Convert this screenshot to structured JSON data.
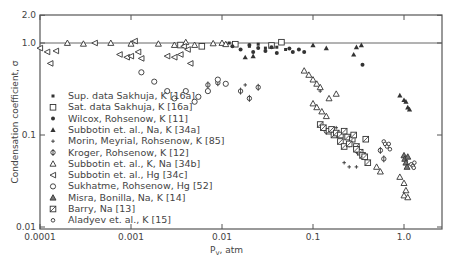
{
  "chart_data": {
    "type": "scatter",
    "title": "",
    "xlabel": "P_v, atm",
    "ylabel": "Condensation coefficient, σ",
    "xscale": "log",
    "yscale": "log",
    "xlim": [
      0.0001,
      3.0
    ],
    "ylim": [
      0.01,
      2.0
    ],
    "x_ticks": [
      "0.0001",
      "0.001",
      "0.01",
      "0.1",
      "1.0"
    ],
    "y_ticks": [
      "0.01",
      "0.1",
      "1.0",
      "2.0"
    ],
    "reference_line": {
      "y": 1.0
    },
    "legend_position": "inside-left",
    "grid": false,
    "series": [
      {
        "name": "Sup. data Sakhuja, K [16a]",
        "marker": "filled-square-small",
        "points": [
          [
            0.012,
            1.0
          ],
          [
            0.014,
            0.95
          ],
          [
            0.02,
            0.92
          ],
          [
            0.025,
            0.97
          ],
          [
            0.03,
            0.88
          ],
          [
            0.04,
            0.9
          ],
          [
            0.05,
            0.85
          ]
        ]
      },
      {
        "name": "Sat. data Sakhuja, K [16a]",
        "marker": "open-square",
        "points": [
          [
            0.0035,
            0.95
          ],
          [
            0.006,
            0.92
          ],
          [
            0.014,
            0.97
          ],
          [
            0.035,
            0.94
          ],
          [
            0.045,
            1.02
          ]
        ]
      },
      {
        "name": "Wilcox, Rohsenow, K [11]",
        "marker": "filled-circle",
        "points": [
          [
            0.013,
            0.92
          ],
          [
            0.016,
            0.85
          ],
          [
            0.02,
            0.95
          ],
          [
            0.022,
            0.8
          ],
          [
            0.025,
            0.88
          ],
          [
            0.03,
            0.82
          ],
          [
            0.035,
            0.9
          ],
          [
            0.04,
            0.78
          ],
          [
            0.055,
            0.87
          ],
          [
            0.06,
            0.8
          ],
          [
            0.07,
            0.85
          ],
          [
            0.08,
            0.8
          ],
          [
            0.35,
            0.58
          ]
        ]
      },
      {
        "name": "Subbotin et. al., Na, K [34a]",
        "marker": "filled-triangle",
        "points": [
          [
            0.018,
            0.7
          ],
          [
            0.022,
            0.72
          ],
          [
            0.1,
            0.95
          ],
          [
            0.14,
            0.88
          ],
          [
            0.3,
            0.9
          ],
          [
            0.34,
            0.95
          ],
          [
            0.28,
            0.75
          ],
          [
            0.9,
            0.27
          ],
          [
            1.0,
            0.24
          ],
          [
            1.05,
            0.23
          ],
          [
            1.1,
            0.2
          ],
          [
            1.15,
            0.19
          ]
        ]
      },
      {
        "name": "Morin, Meyrial, Rohsenow, K [85]",
        "marker": "plus",
        "points": [
          [
            0.018,
            0.35
          ],
          [
            0.12,
            0.3
          ],
          [
            0.15,
            0.11
          ],
          [
            0.17,
            0.1
          ],
          [
            0.18,
            0.12
          ],
          [
            0.22,
            0.05
          ],
          [
            0.25,
            0.045
          ],
          [
            0.3,
            0.045
          ]
        ]
      },
      {
        "name": "Kroger, Rohsenow, K [12]",
        "marker": "circle-bar",
        "points": [
          [
            0.007,
            0.35
          ],
          [
            0.009,
            0.37
          ],
          [
            0.016,
            0.3
          ],
          [
            0.02,
            0.25
          ],
          [
            0.025,
            0.33
          ],
          [
            0.14,
            0.11
          ],
          [
            0.25,
            0.08
          ],
          [
            0.3,
            0.068
          ],
          [
            0.55,
            0.068
          ],
          [
            0.6,
            0.055
          ]
        ]
      },
      {
        "name": "Subbotin et. al., K, Na [34b]",
        "marker": "open-triangle",
        "points": [
          [
            0.0002,
            1.0
          ],
          [
            0.0003,
            0.98
          ],
          [
            0.0006,
            1.0
          ],
          [
            0.001,
            0.98
          ],
          [
            0.002,
            0.98
          ],
          [
            0.003,
            0.95
          ],
          [
            0.004,
            1.02
          ],
          [
            0.005,
            0.95
          ],
          [
            0.008,
            0.99
          ],
          [
            0.01,
            1.0
          ],
          [
            0.011,
            0.97
          ],
          [
            0.08,
            0.5
          ],
          [
            0.09,
            0.45
          ],
          [
            0.1,
            0.4
          ],
          [
            0.11,
            0.36
          ],
          [
            0.12,
            0.33
          ],
          [
            0.1,
            0.22
          ],
          [
            0.11,
            0.2
          ],
          [
            0.125,
            0.18
          ],
          [
            0.14,
            0.16
          ],
          [
            0.15,
            0.25
          ],
          [
            0.18,
            0.28
          ],
          [
            0.5,
            0.045
          ],
          [
            0.55,
            0.04
          ],
          [
            0.9,
            0.035
          ],
          [
            1.0,
            0.03
          ],
          [
            1.05,
            0.025
          ],
          [
            1.0,
            0.022
          ],
          [
            1.1,
            0.021
          ]
        ]
      },
      {
        "name": "Subbotin et. al., Hg [34c]",
        "marker": "open-left-triangle",
        "points": [
          [
            0.0001,
            0.88
          ],
          [
            0.00012,
            0.8
          ],
          [
            0.00015,
            0.82
          ],
          [
            0.00013,
            0.6
          ],
          [
            0.0004,
            1.0
          ],
          [
            0.00075,
            0.75
          ],
          [
            0.0009,
            0.7
          ],
          [
            0.001,
            0.72
          ],
          [
            0.0011,
            1.05
          ],
          [
            0.0012,
            0.8
          ],
          [
            0.0013,
            0.68
          ],
          [
            0.0025,
            0.72
          ],
          [
            0.003,
            0.7
          ],
          [
            0.0035,
            0.75
          ],
          [
            0.0038,
            0.92
          ],
          [
            0.0042,
            0.85
          ],
          [
            0.0045,
            0.6
          ]
        ]
      },
      {
        "name": "Sukhatme, Rohsenow, Hg [52]",
        "marker": "circle-tick",
        "points": [
          [
            0.0013,
            0.48
          ],
          [
            0.0018,
            0.38
          ],
          [
            0.0025,
            0.3
          ],
          [
            0.003,
            0.25
          ],
          [
            0.004,
            0.3
          ],
          [
            0.005,
            0.23
          ],
          [
            0.0055,
            0.26
          ],
          [
            0.007,
            0.3
          ],
          [
            0.009,
            0.4
          ],
          [
            0.011,
            0.36
          ]
        ]
      },
      {
        "name": "Misra, Bonilla, Na, K [14]",
        "marker": "filled-triangle-hatched",
        "points": [
          [
            1.0,
            0.06
          ],
          [
            1.02,
            0.055
          ],
          [
            1.05,
            0.05
          ],
          [
            1.1,
            0.058
          ],
          [
            1.08,
            0.045
          ]
        ]
      },
      {
        "name": "Barry, Na [13]",
        "marker": "hatched-square",
        "points": [
          [
            0.12,
            0.13
          ],
          [
            0.13,
            0.12
          ],
          [
            0.15,
            0.11
          ],
          [
            0.16,
            0.115
          ],
          [
            0.17,
            0.1
          ],
          [
            0.18,
            0.105
          ],
          [
            0.2,
            0.1
          ],
          [
            0.22,
            0.11
          ],
          [
            0.24,
            0.095
          ],
          [
            0.27,
            0.09
          ],
          [
            0.2,
            0.085
          ],
          [
            0.22,
            0.075
          ],
          [
            0.25,
            0.08
          ],
          [
            0.3,
            0.075
          ],
          [
            0.33,
            0.065
          ],
          [
            0.35,
            0.06
          ],
          [
            0.37,
            0.058
          ],
          [
            0.3,
            0.07
          ],
          [
            0.28,
            0.1
          ],
          [
            0.38,
            0.09
          ],
          [
            0.4,
            0.05
          ]
        ]
      },
      {
        "name": "Aladyev et. al., K [15]",
        "marker": "small-open-circle",
        "points": [
          [
            0.6,
            0.085
          ],
          [
            0.62,
            0.08
          ],
          [
            0.65,
            0.075
          ],
          [
            0.68,
            0.08
          ],
          [
            0.7,
            0.07
          ],
          [
            1.2,
            0.048
          ],
          [
            1.25,
            0.046
          ],
          [
            1.3,
            0.05
          ],
          [
            1.28,
            0.044
          ]
        ]
      }
    ]
  },
  "axes": {
    "xlabel": "P",
    "xlabel_sub": "v",
    "xlabel_rest": ", atm",
    "ylabel": "Condensation coefficient, σ"
  }
}
